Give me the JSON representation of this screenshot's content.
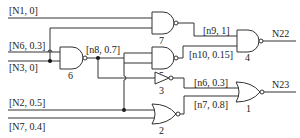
{
  "diagram": {
    "type": "logic-circuit",
    "inputs": [
      {
        "id": "N1",
        "label": "[N1, 0]"
      },
      {
        "id": "N6",
        "label": "[N6, 0.3]"
      },
      {
        "id": "N3",
        "label": "[N3, 0]"
      },
      {
        "id": "N2",
        "label": "[N2, 0.5]"
      },
      {
        "id": "N7",
        "label": "[N7, 0.4]"
      }
    ],
    "internal_nets": [
      {
        "id": "n8",
        "label": "[n8, 0.7]"
      },
      {
        "id": "n9",
        "label": "[n9, 1]"
      },
      {
        "id": "n10",
        "label": "[n10, 0.15]"
      },
      {
        "id": "n6",
        "label": "[n6, 0.3]"
      },
      {
        "id": "n7",
        "label": "[n7, 0.8]"
      }
    ],
    "outputs": [
      {
        "id": "N22",
        "label": "N22"
      },
      {
        "id": "N23",
        "label": "N23"
      }
    ],
    "gates": [
      {
        "num": "1",
        "type": "NOR",
        "inputs": [
          "n6",
          "n7"
        ],
        "output": "N23"
      },
      {
        "num": "2",
        "type": "NOR",
        "inputs": [
          "N2",
          "N7"
        ],
        "output": "n7"
      },
      {
        "num": "3",
        "type": "NOT",
        "inputs": [
          "n8"
        ],
        "output": "n6"
      },
      {
        "num": "4",
        "type": "NAND",
        "inputs": [
          "n9",
          "n10"
        ],
        "output": "N22"
      },
      {
        "num": "5",
        "type": "NAND",
        "inputs": [
          "n8",
          "n8"
        ],
        "output": "n10"
      },
      {
        "num": "6",
        "type": "NAND",
        "inputs": [
          "N6",
          "N3"
        ],
        "output": "n8"
      },
      {
        "num": "7",
        "type": "NAND",
        "inputs": [
          "N1",
          "N3"
        ],
        "output": "n9"
      }
    ]
  }
}
